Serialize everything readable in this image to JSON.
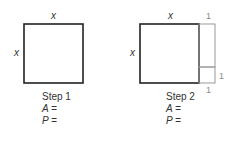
{
  "step1": {
    "top_label": "x",
    "side_label": "x",
    "caption": "Step 1",
    "area_line": "A =",
    "perimeter_line": "P ="
  },
  "step2": {
    "top_label": "x",
    "side_label": "x",
    "strip_top_label": "1",
    "strip_side_label": "1",
    "strip_bottom_label": "1",
    "caption": "Step 2",
    "area_line": "A =",
    "perimeter_line": "P ="
  },
  "colors": {
    "square_stroke": "#222222",
    "strip_stroke": "#999999",
    "text": "#333333"
  }
}
